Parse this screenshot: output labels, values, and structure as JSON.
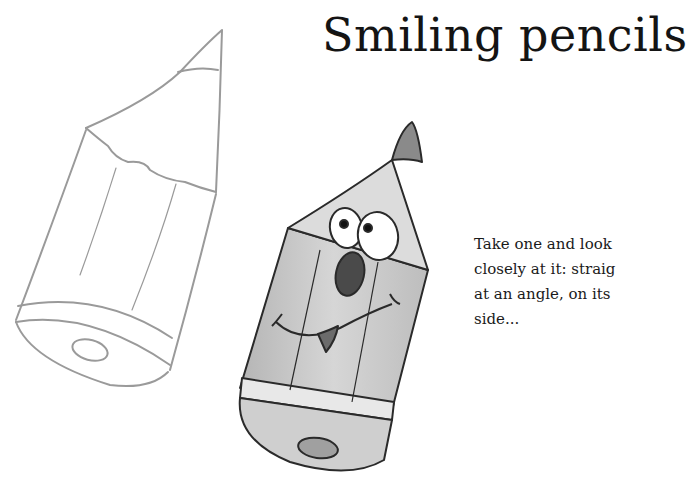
{
  "page": {
    "title": "Smiling pencils",
    "paragraph_lines": [
      "Take one and look",
      "closely at it: straig",
      "at an angle, on its",
      "side..."
    ]
  },
  "illustrations": {
    "sketch_pencil": "outline-pencil-sketch",
    "cartoon_pencil": "smiling-cartoon-pencil"
  },
  "colors": {
    "background": "#ffffff",
    "text": "#141414",
    "sketch_stroke": "#9a9a9a",
    "pencil_body": "#c8c8c8",
    "pencil_tip": "#8a8a8a",
    "outline": "#2a2a2a"
  }
}
